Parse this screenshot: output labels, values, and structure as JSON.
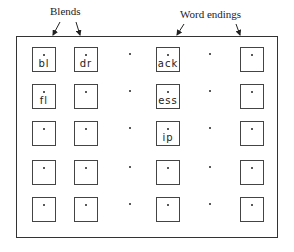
{
  "labels": {
    "blends": "Blends",
    "word_endings": "Word endings"
  },
  "grid": {
    "rows": 5,
    "columns": [
      "box",
      "box",
      "dot",
      "box",
      "dot",
      "box"
    ],
    "cells": [
      [
        "bl",
        "dr",
        "",
        "ack",
        "",
        ""
      ],
      [
        "fl",
        "",
        "",
        "ess",
        "",
        ""
      ],
      [
        "",
        "",
        "",
        "ip",
        "",
        ""
      ],
      [
        "",
        "",
        "",
        "",
        "",
        ""
      ],
      [
        "",
        "",
        "",
        "",
        "",
        ""
      ]
    ]
  },
  "colors": {
    "ink": "#222222",
    "background": "#ffffff"
  }
}
